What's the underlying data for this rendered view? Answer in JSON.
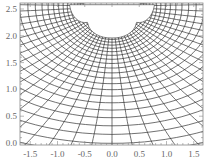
{
  "chart_data": {
    "type": "line",
    "title": "",
    "xlabel": "",
    "ylabel": "",
    "xlim": [
      -1.6,
      1.6
    ],
    "ylim": [
      -0.05,
      2.55
    ],
    "x_ticks": [
      "-1.5",
      "-1.0",
      "-0.5",
      "0.0",
      "0.5",
      "1.0",
      "1.5"
    ],
    "y_ticks": [
      "0.0",
      "0.5",
      "1.0",
      "1.5",
      "2.0",
      "2.5"
    ],
    "x_tick_values": [
      -1.5,
      -1.0,
      -0.5,
      0.0,
      0.5,
      1.0,
      1.5
    ],
    "y_tick_values": [
      0.0,
      0.5,
      1.0,
      1.5,
      2.0,
      2.5
    ],
    "grid": false,
    "frame": true,
    "line_color": "#333333",
    "hole": {
      "center": [
        0.0,
        2.5
      ],
      "shape": "scalloped (three lobes)",
      "approx_extent_x": [
        -0.75,
        0.75
      ],
      "approx_bottom_y": 2.0
    }
  }
}
